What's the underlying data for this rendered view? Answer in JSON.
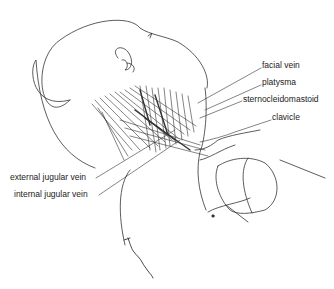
{
  "figure": {
    "type": "anatomical line illustration"
  },
  "labels": [
    {
      "id": "facial-vein",
      "text": "facial vein",
      "x": 262,
      "y": 65
    },
    {
      "id": "platysma",
      "text": "platysma",
      "x": 262,
      "y": 82
    },
    {
      "id": "sternocleidomastoid",
      "text": "sternocleidomastoid",
      "x": 243,
      "y": 98
    },
    {
      "id": "clavicle",
      "text": "clavicle",
      "x": 272,
      "y": 117
    },
    {
      "id": "external-jugular-vein",
      "text": "external jugular vein",
      "x": 10,
      "y": 176
    },
    {
      "id": "internal-jugular-vein",
      "text": "internal jugular vein",
      "x": 14,
      "y": 193
    }
  ],
  "signature": {
    "text": "J. Bresnihan"
  },
  "colors": {
    "line": "#333333",
    "text": "#222222",
    "background": "#ffffff"
  }
}
